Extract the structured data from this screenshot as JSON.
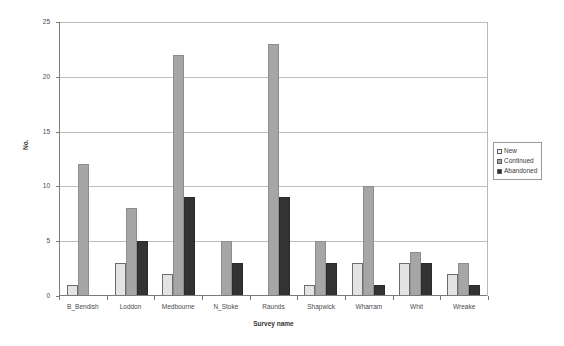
{
  "chart_data": {
    "type": "bar",
    "title": "",
    "xlabel": "Survey name",
    "ylabel": "No.",
    "ylim": [
      0,
      25
    ],
    "yticks": [
      0,
      5,
      10,
      15,
      20,
      25
    ],
    "grid": true,
    "legend_position": "right",
    "categories": [
      "B_Bendish",
      "Loddon",
      "Medbourne",
      "N_Stoke",
      "Raunds",
      "Shapwick",
      "Wharram",
      "Whit",
      "Wreake"
    ],
    "series": [
      {
        "name": "New",
        "color": "#e3e3e3",
        "values": [
          1,
          3,
          2,
          0,
          0,
          1,
          3,
          3,
          2
        ]
      },
      {
        "name": "Continued",
        "color": "#a6a6a6",
        "values": [
          12,
          8,
          22,
          5,
          23,
          5,
          10,
          4,
          3
        ]
      },
      {
        "name": "Abandoned",
        "color": "#333333",
        "values": [
          0,
          5,
          9,
          3,
          9,
          3,
          1,
          3,
          1
        ]
      }
    ]
  },
  "legend": {
    "items": [
      {
        "label": "New"
      },
      {
        "label": "Continued"
      },
      {
        "label": "Abandoned"
      }
    ]
  }
}
